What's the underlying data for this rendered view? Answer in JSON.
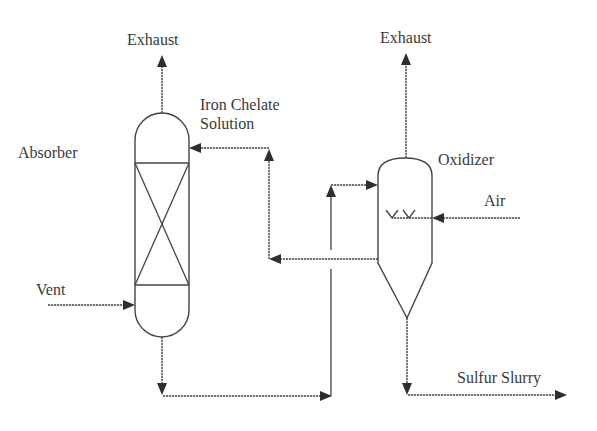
{
  "diagram": {
    "type": "process-flow",
    "colors": {
      "line": "#444444",
      "text": "#3a3a3a",
      "background": "#ffffff"
    },
    "equipment": [
      {
        "id": "absorber",
        "label": "Absorber",
        "internals": "packed-bed (X marks)"
      },
      {
        "id": "oxidizer",
        "label": "Oxidizer",
        "internals": "air sparger, conical bottom"
      }
    ],
    "streams": {
      "absorber_exhaust": "Exhaust",
      "oxidizer_exhaust": "Exhaust",
      "iron_chelate_line1": "Iron Chelate",
      "iron_chelate_line2": "Solution",
      "vent": "Vent",
      "air": "Air",
      "sulfur_slurry": "Sulfur Slurry"
    },
    "connections": [
      {
        "from": "Vent",
        "to": "Absorber (lower side)"
      },
      {
        "from": "Absorber (top)",
        "to": "Exhaust"
      },
      {
        "from": "Absorber (bottom)",
        "to": "Oxidizer (upper side)"
      },
      {
        "from": "Oxidizer (side outlet)",
        "to": "Absorber (upper side) as Iron Chelate Solution"
      },
      {
        "from": "Air",
        "to": "Oxidizer sparger"
      },
      {
        "from": "Oxidizer (top)",
        "to": "Exhaust"
      },
      {
        "from": "Oxidizer (cone bottom)",
        "to": "Sulfur Slurry"
      }
    ]
  }
}
